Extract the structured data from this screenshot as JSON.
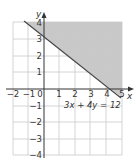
{
  "diagram": {
    "equation_label": "3x + 4y = 12",
    "x_axis_label": "x",
    "y_axis_label": "y",
    "x_ticks": [
      "−2",
      "−1",
      "0",
      "1",
      "2",
      "3",
      "4",
      "5"
    ],
    "y_ticks": [
      "4",
      "3",
      "2",
      "1",
      "−1",
      "−2",
      "−3",
      "−4"
    ],
    "x_range": [
      -2,
      5
    ],
    "y_range": [
      -4,
      4
    ],
    "boundary_line": {
      "a": 3,
      "b": 4,
      "c": 12,
      "style": "solid"
    },
    "shaded_region": "above line (3x + 4y ≥ 12)",
    "colors": {
      "shade": "#c8c8c8",
      "grid": "#c8c8c8",
      "axis": "#333333",
      "line": "#444444"
    }
  }
}
